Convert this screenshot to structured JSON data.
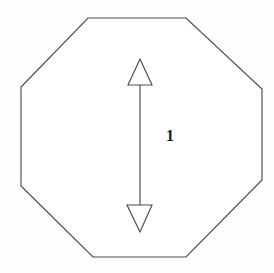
{
  "figure": {
    "name": "octagon-with-vertical-double-arrow",
    "background_color": "#fefefe",
    "line_color": "#4a4a4a",
    "label_color": "#1a1a1a",
    "canvas": {
      "width": 274,
      "height": 273
    },
    "shape": {
      "name": "octagon",
      "sides": 8,
      "fill": "#ffffff",
      "stroke_width": 1.15,
      "points": "88,18 186,18 262,89 262,180 186,257 93,257 21,186 21,87"
    },
    "dimension_arrow": {
      "name": "vertical-double-headed-arrow",
      "orientation": "vertical",
      "shaft": {
        "x": 140,
        "y_top": 85,
        "y_bottom": 205
      },
      "head_up": {
        "points": "140,59 152,85 128,85"
      },
      "head_down": {
        "points": "140,232 127,205 152,205"
      }
    },
    "label": {
      "text": "1",
      "x": 166,
      "y": 128,
      "font_size_px": 16,
      "bold": true
    }
  }
}
